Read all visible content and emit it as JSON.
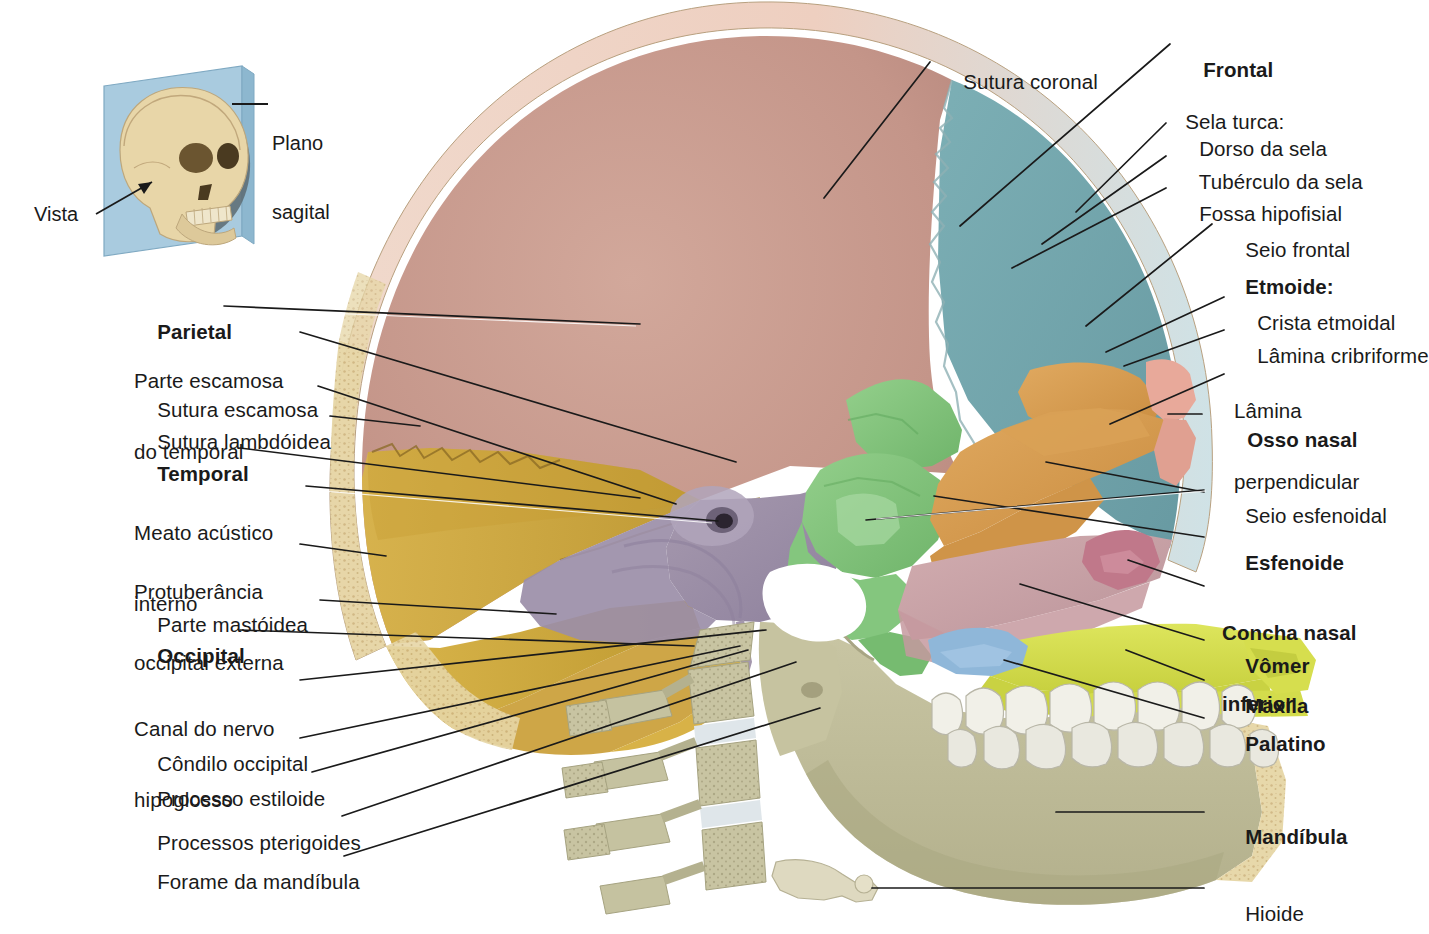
{
  "figure": {
    "type": "anatomical-illustration",
    "language": "pt-BR"
  },
  "inset": {
    "name": "orientation-inset",
    "plane_label": "Plano\nsagital",
    "view_label": "Vista",
    "plane_label_line1": "Plano",
    "plane_label_line2": "sagital",
    "panel_color": "#a9cbdf",
    "skull_color": "#e8d6a8"
  },
  "colors": {
    "parietal": "#c69a8e",
    "frontal": "#73a6ad",
    "temporal_squamous": "#c8a03a",
    "temporal_petrous": "#9b8ea8",
    "occipital": "#d2aa3d",
    "sphenoid": "#7fc27a",
    "ethmoid": "#d79a4f",
    "nasal_bone": "#e8a99a",
    "vomer": "#c9a3a8",
    "inferior_concha": "#c0788a",
    "maxilla": "#d6de4e",
    "palatine": "#8fb7d9",
    "mandible": "#bfbd9a",
    "diploe": "#e7d9a8",
    "teeth": "#efeee6",
    "vertebrae": "#c2bfa0",
    "leader_line": "#1a1a1a"
  },
  "labels_left": [
    {
      "id": "parietal",
      "text": "Parietal",
      "bold": true,
      "x": 134,
      "y": 300,
      "lines": [
        "Parietal"
      ]
    },
    {
      "id": "parte-escamosa-temporal",
      "text": "Parte escamosa\ndo temporal",
      "bold": false,
      "x": 134,
      "y": 328,
      "lines": [
        "Parte escamosa",
        "do temporal"
      ]
    },
    {
      "id": "sutura-escamosa",
      "text": "Sutura escamosa",
      "bold": false,
      "x": 134,
      "y": 378,
      "lines": [
        "Sutura escamosa"
      ]
    },
    {
      "id": "sutura-lambdoidea",
      "text": "Sutura lambdóidea",
      "bold": false,
      "x": 134,
      "y": 410,
      "lines": [
        "Sutura lambdóidea"
      ]
    },
    {
      "id": "temporal",
      "text": "Temporal",
      "bold": true,
      "x": 134,
      "y": 442,
      "lines": [
        "Temporal"
      ]
    },
    {
      "id": "meato-acustico-interno",
      "text": "Meato acústico\ninterno",
      "bold": false,
      "x": 134,
      "y": 478,
      "lines": [
        "Meato acústico",
        "interno"
      ]
    },
    {
      "id": "protuberancia-occipital-externa",
      "text": "Protuberância\noccipital externa",
      "bold": false,
      "x": 134,
      "y": 537,
      "lines": [
        "Protuberância",
        "occipital externa"
      ]
    },
    {
      "id": "parte-mastoidea",
      "text": "Parte mastóidea",
      "bold": false,
      "x": 134,
      "y": 593,
      "lines": [
        "Parte mastóidea"
      ]
    },
    {
      "id": "occipital",
      "text": "Occipital",
      "bold": true,
      "x": 134,
      "y": 622,
      "lines": [
        "Occipital"
      ]
    },
    {
      "id": "canal-nervo-hipoglosso",
      "text": "Canal do nervo\nhipoglosso",
      "bold": false,
      "x": 134,
      "y": 674,
      "lines": [
        "Canal do nervo",
        "hipoglosso"
      ]
    },
    {
      "id": "condilo-occipital",
      "text": "Côndilo occipital",
      "bold": false,
      "x": 134,
      "y": 731,
      "lines": [
        "Côndilo occipital"
      ]
    },
    {
      "id": "processo-estiloide",
      "text": "Processo estiloide",
      "bold": false,
      "x": 134,
      "y": 766,
      "lines": [
        "Processo estiloide"
      ]
    },
    {
      "id": "processos-pterigoides",
      "text": "Processos pterigoides",
      "bold": false,
      "x": 134,
      "y": 810,
      "lines": [
        "Processos pterigoides"
      ]
    },
    {
      "id": "forame-da-mandibula",
      "text": "Forame da mandíbula",
      "bold": false,
      "x": 134,
      "y": 849,
      "lines": [
        "Forame da mandíbula"
      ]
    }
  ],
  "labels_right": [
    {
      "id": "frontal",
      "text": "Frontal",
      "bold": true,
      "x": 1180,
      "y": 38,
      "lines": [
        "Frontal"
      ]
    },
    {
      "id": "sela-turca",
      "text": "Sela turca:",
      "bold": false,
      "x": 1162,
      "y": 88,
      "lines": [
        "Sela turca:"
      ]
    },
    {
      "id": "dorso-da-sela",
      "text": "Dorso da sela",
      "bold": false,
      "x": 1176,
      "y": 117,
      "lines": [
        "Dorso da sela"
      ]
    },
    {
      "id": "tuberculo-da-sela",
      "text": "Tubérculo da sela",
      "bold": false,
      "x": 1176,
      "y": 150,
      "lines": [
        "Tubérculo da sela"
      ]
    },
    {
      "id": "fossa-hipofisial",
      "text": "Fossa hipofisial",
      "bold": false,
      "x": 1176,
      "y": 182,
      "lines": [
        "Fossa hipofisial"
      ]
    },
    {
      "id": "seio-frontal",
      "text": "Seio frontal",
      "bold": false,
      "x": 1222,
      "y": 218,
      "lines": [
        "Seio frontal"
      ]
    },
    {
      "id": "etmoide",
      "text": "Etmoide:",
      "bold": true,
      "x": 1222,
      "y": 255,
      "lines": [
        "Etmoide:"
      ]
    },
    {
      "id": "crista-etmoidal",
      "text": "Crista etmoidal",
      "bold": false,
      "x": 1234,
      "y": 291,
      "lines": [
        "Crista etmoidal"
      ]
    },
    {
      "id": "lamina-cribriforme",
      "text": "Lâmina cribriforme",
      "bold": false,
      "x": 1234,
      "y": 324,
      "lines": [
        "Lâmina cribriforme"
      ]
    },
    {
      "id": "lamina-perpendicular",
      "text": "Lâmina\nperpendicular",
      "bold": false,
      "x": 1234,
      "y": 356,
      "lines": [
        "Lâmina",
        "perpendicular"
      ]
    },
    {
      "id": "osso-nasal",
      "text": "Osso nasal",
      "bold": true,
      "x": 1224,
      "y": 408,
      "lines": [
        "Osso nasal"
      ]
    },
    {
      "id": "seio-esfenoidal",
      "text": "Seio esfenoidal",
      "bold": false,
      "x": 1222,
      "y": 484,
      "lines": [
        "Seio esfenoidal"
      ]
    },
    {
      "id": "esfenoide",
      "text": "Esfenoide",
      "bold": true,
      "x": 1222,
      "y": 531,
      "lines": [
        "Esfenoide"
      ]
    },
    {
      "id": "concha-nasal-inferior",
      "text": "Concha nasal\ninferior",
      "bold": true,
      "x": 1222,
      "y": 578,
      "lines": [
        "Concha nasal",
        "inferior"
      ]
    },
    {
      "id": "vomer",
      "text": "Vômer",
      "bold": true,
      "x": 1222,
      "y": 634,
      "lines": [
        "Vômer"
      ]
    },
    {
      "id": "maxila",
      "text": "Maxila",
      "bold": true,
      "x": 1222,
      "y": 674,
      "lines": [
        "Maxila"
      ]
    },
    {
      "id": "palatino",
      "text": "Palatino",
      "bold": true,
      "x": 1222,
      "y": 712,
      "lines": [
        "Palatino"
      ]
    },
    {
      "id": "mandibula",
      "text": "Mandíbula",
      "bold": true,
      "x": 1222,
      "y": 805,
      "lines": [
        "Mandíbula"
      ]
    },
    {
      "id": "hioide",
      "text": "Hioide",
      "bold": false,
      "x": 1222,
      "y": 882,
      "lines": [
        "Hioide"
      ]
    }
  ],
  "labels_top": [
    {
      "id": "sutura-coronal",
      "text": "Sutura coronal",
      "bold": false,
      "x": 940,
      "y": 52,
      "lines": [
        "Sutura coronal"
      ]
    }
  ],
  "structures": [
    {
      "id": "parietal-bone",
      "label": "Parietal",
      "color": "#c69a8e"
    },
    {
      "id": "frontal-bone",
      "label": "Frontal",
      "color": "#73a6ad"
    },
    {
      "id": "temporal-bone",
      "label": "Temporal",
      "color": "#9b8ea8"
    },
    {
      "id": "occipital-bone",
      "label": "Occipital",
      "color": "#d2aa3d"
    },
    {
      "id": "sphenoid-bone",
      "label": "Esfenoide",
      "color": "#7fc27a"
    },
    {
      "id": "ethmoid-bone",
      "label": "Etmoide",
      "color": "#d79a4f"
    },
    {
      "id": "nasal-bone",
      "label": "Osso nasal",
      "color": "#e8a99a"
    },
    {
      "id": "vomer-bone",
      "label": "Vômer",
      "color": "#c9a3a8"
    },
    {
      "id": "inferior-nasal-concha",
      "label": "Concha nasal inferior",
      "color": "#c0788a"
    },
    {
      "id": "maxilla-bone",
      "label": "Maxila",
      "color": "#d6de4e"
    },
    {
      "id": "palatine-bone",
      "label": "Palatino",
      "color": "#8fb7d9"
    },
    {
      "id": "mandible-bone",
      "label": "Mandíbula",
      "color": "#bfbd9a"
    },
    {
      "id": "hyoid-bone",
      "label": "Hioide",
      "color": "#ded9c0"
    },
    {
      "id": "cervical-vertebrae",
      "label": "Vértebras cervicais",
      "color": "#c2bfa0"
    },
    {
      "id": "teeth",
      "label": "Dentes",
      "color": "#efeee6"
    }
  ]
}
